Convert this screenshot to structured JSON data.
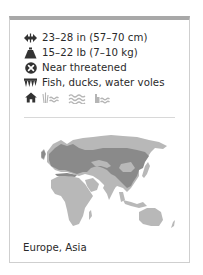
{
  "card": {
    "accent_color": "#a8a8a8",
    "facts": [
      {
        "icon": "length-arrows-icon",
        "text": "23–28 in (57–70 cm)"
      },
      {
        "icon": "weight-icon",
        "text": "15–22 lb (7–10 kg)"
      },
      {
        "icon": "conservation-status-icon",
        "text": "Near threatened"
      },
      {
        "icon": "diet-teeth-icon",
        "text": "Fish, ducks, water voles"
      }
    ],
    "habitat": {
      "icon": "habitat-home-icon",
      "types": [
        "wetland-icon",
        "river-icon",
        "coast-icon"
      ]
    },
    "map": {
      "description": "World map centered on Eurasia with distribution range highlighted",
      "land_color": "#b8b8b8",
      "range_color": "#8a8a8a"
    },
    "region": "Europe, Asia"
  }
}
